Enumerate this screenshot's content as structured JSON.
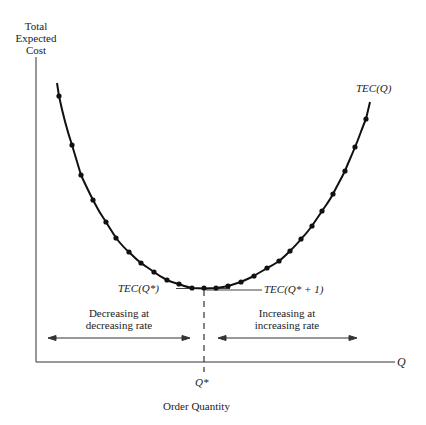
{
  "chart_data": {
    "type": "line",
    "title": "",
    "ylabel": "Total Expected Cost",
    "xlabel": "Order Quantity",
    "x_axis_symbol": "Q",
    "x_tick_labels": [
      "Q*"
    ],
    "curve_label": "TEC(Q)",
    "annotations": {
      "min_left": "TEC(Q*)",
      "min_right": "TEC(Q* + 1)",
      "left_region": "Decreasing at decreasing rate",
      "right_region": "Increasing at increasing rate"
    },
    "grid": false,
    "legend": "none",
    "curve_shape": "convex U-shaped, minimum at Q*",
    "points_px": [
      [
        59,
        96
      ],
      [
        72,
        145
      ],
      [
        81,
        175
      ],
      [
        93,
        200
      ],
      [
        106,
        222
      ],
      [
        116,
        238
      ],
      [
        129,
        252
      ],
      [
        141,
        263
      ],
      [
        154,
        272
      ],
      [
        167,
        280
      ],
      [
        179,
        284
      ],
      [
        192,
        288
      ],
      [
        204,
        288
      ],
      [
        216,
        288
      ],
      [
        228,
        286
      ],
      [
        241,
        282
      ],
      [
        254,
        276
      ],
      [
        267,
        268
      ],
      [
        279,
        261
      ],
      [
        290,
        251
      ],
      [
        301,
        239
      ],
      [
        312,
        226
      ],
      [
        322,
        211
      ],
      [
        333,
        194
      ],
      [
        345,
        171
      ],
      [
        355,
        147
      ],
      [
        366,
        119
      ]
    ]
  },
  "labels": {
    "y_axis_line1": "Total",
    "y_axis_line2": "Expected",
    "y_axis_line3": "Cost",
    "x_axis_symbol": "Q",
    "q_star": "Q*",
    "x_axis_title": "Order Quantity",
    "curve": "TEC(Q)",
    "tec_qstar": "TEC(Q*)",
    "tec_qstar_plus1": "TEC(Q* + 1)",
    "left_line1": "Decreasing at",
    "left_line2": "decreasing rate",
    "right_line1": "Increasing at",
    "right_line2": "increasing rate"
  }
}
